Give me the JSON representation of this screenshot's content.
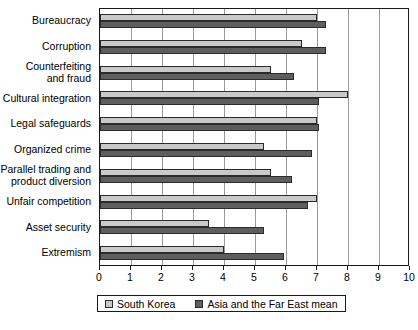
{
  "chart_data": {
    "type": "bar",
    "orientation": "horizontal",
    "title": "",
    "xlabel": "",
    "ylabel": "",
    "xlim": [
      0,
      10
    ],
    "xticks": [
      0,
      1,
      2,
      3,
      4,
      5,
      6,
      7,
      8,
      9,
      10
    ],
    "xtick_labels": [
      "0",
      "1",
      "2",
      "3",
      "4",
      "5",
      "6",
      "7",
      "8",
      "9",
      "10"
    ],
    "grid": true,
    "grid_axis": "x",
    "legend_position": "bottom",
    "categories": [
      "Bureaucracy",
      "Corruption",
      "Counterfeiting\nand fraud",
      "Cultural integration",
      "Legal safeguards",
      "Organized crime",
      "Parallel trading and\nproduct diversion",
      "Unfair competition",
      "Asset security",
      "Extremism"
    ],
    "series": [
      {
        "name": "South Korea",
        "color": "#c9c9c9",
        "values": [
          7.0,
          6.5,
          5.5,
          8.0,
          7.0,
          5.3,
          5.5,
          7.0,
          3.5,
          4.0
        ]
      },
      {
        "name": "Asia and the Far East mean",
        "color": "#5e5e5e",
        "values": [
          7.3,
          7.3,
          6.25,
          7.05,
          7.05,
          6.85,
          6.2,
          6.7,
          5.3,
          5.95
        ]
      }
    ]
  },
  "legend": {
    "items": [
      {
        "label": "South Korea",
        "swatch": "light"
      },
      {
        "label": "Asia and the Far East mean",
        "swatch": "dark"
      }
    ]
  },
  "colors": {
    "series_light": "#c9c9c9",
    "series_dark": "#5e5e5e",
    "axis": "#1a1a1a",
    "grid": "#9a9a9a",
    "background": "#ffffff"
  }
}
